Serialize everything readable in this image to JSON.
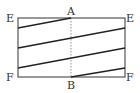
{
  "diagram": {
    "labels": {
      "top_left": "E",
      "top_mid": "A",
      "top_right": "E",
      "bottom_left": "F",
      "bottom_mid": "B",
      "bottom_right": "F"
    },
    "rect": {
      "x1": 18,
      "y1": 18,
      "x2": 125,
      "y2": 77
    },
    "fold_line": {
      "x": 71,
      "style": "dotted"
    },
    "segments": [
      {
        "x1": 18,
        "y1": 28,
        "x2": 71,
        "y2": 18
      },
      {
        "x1": 18,
        "y1": 48,
        "x2": 125,
        "y2": 28
      },
      {
        "x1": 18,
        "y1": 68,
        "x2": 125,
        "y2": 48
      },
      {
        "x1": 71,
        "y1": 77,
        "x2": 125,
        "y2": 68
      }
    ],
    "colors": {
      "frame": "#555555",
      "segment": "#222222",
      "fold": "#777777"
    }
  }
}
